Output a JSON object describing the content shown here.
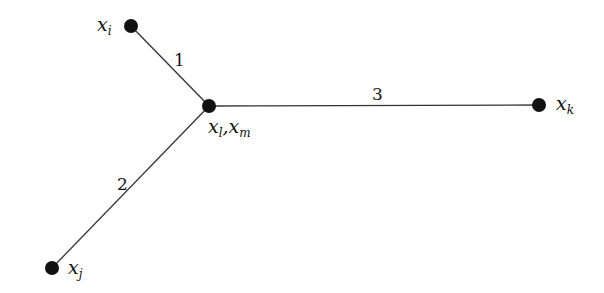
{
  "diagram": {
    "type": "tree-graph",
    "nodes": [
      {
        "id": "xi",
        "base": "x",
        "sub": "i"
      },
      {
        "id": "xlm",
        "base": "x",
        "sub": "l",
        "base2": "x",
        "sub2": "m"
      },
      {
        "id": "xk",
        "base": "x",
        "sub": "k"
      },
      {
        "id": "xj",
        "base": "x",
        "sub": "j"
      }
    ],
    "edges": [
      {
        "from": "xi",
        "to": "xlm",
        "label": "1"
      },
      {
        "from": "xj",
        "to": "xlm",
        "label": "2"
      },
      {
        "from": "xlm",
        "to": "xk",
        "label": "3"
      }
    ],
    "colors": {
      "node": "#111111",
      "edge": "#333333",
      "background": "#ffffff"
    }
  }
}
